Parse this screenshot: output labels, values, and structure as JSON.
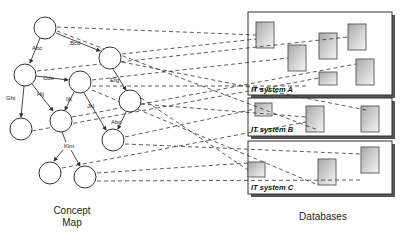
{
  "concept_map": {
    "caption_line1": "Concept",
    "caption_line2": "Map",
    "edge_labels": {
      "a_c": "Abc",
      "a_b": "Bcd",
      "c_d": "Cde",
      "b_e": "Efg",
      "c_g": "Ghi",
      "c_f": "Hij",
      "d_f": "Ijk",
      "d_h": "Jkl",
      "e_h": "Abc",
      "f_ij": "Klm"
    }
  },
  "databases": {
    "caption": "Databases",
    "systems": [
      {
        "label": "IT system A"
      },
      {
        "label": "IT system B"
      },
      {
        "label": "IT system C"
      }
    ]
  },
  "colors": {
    "stroke": "#333333",
    "db_fill_light": "#f4f4f4",
    "db_fill_dark": "#9a9a9a"
  }
}
